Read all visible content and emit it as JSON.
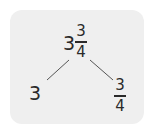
{
  "diagram": {
    "type": "number-bond",
    "root": {
      "whole": "3",
      "numerator": "3",
      "denominator": "4",
      "label": "3 3/4"
    },
    "left": {
      "value": "3"
    },
    "right": {
      "numerator": "3",
      "denominator": "4",
      "label": "3/4"
    }
  },
  "colors": {
    "background": "#ffffff",
    "card": "#efefef",
    "text": "#2a2a2a"
  }
}
